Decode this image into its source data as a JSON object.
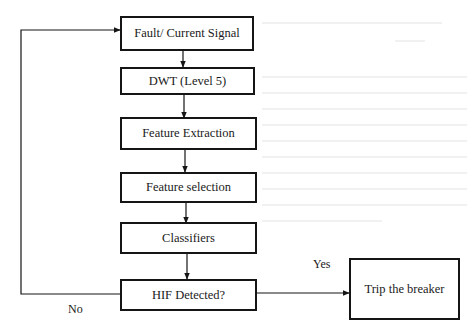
{
  "diagram": {
    "type": "flowchart",
    "nodes": [
      {
        "id": "signal",
        "label": "Fault/ Current Signal"
      },
      {
        "id": "dwt",
        "label": "DWT (Level 5)"
      },
      {
        "id": "extraction",
        "label": "Feature Extraction"
      },
      {
        "id": "selection",
        "label": "Feature selection"
      },
      {
        "id": "classifiers",
        "label": "Classifiers"
      },
      {
        "id": "decision",
        "label": "HIF Detected?"
      },
      {
        "id": "trip",
        "label": "Trip the breaker"
      }
    ],
    "edges": [
      {
        "from": "signal",
        "to": "dwt",
        "label": ""
      },
      {
        "from": "dwt",
        "to": "extraction",
        "label": ""
      },
      {
        "from": "extraction",
        "to": "selection",
        "label": ""
      },
      {
        "from": "selection",
        "to": "classifiers",
        "label": ""
      },
      {
        "from": "classifiers",
        "to": "decision",
        "label": ""
      },
      {
        "from": "decision",
        "to": "trip",
        "label": "Yes"
      },
      {
        "from": "decision",
        "to": "signal",
        "label": "No"
      }
    ],
    "edge_labels": {
      "yes": "Yes",
      "no": "No"
    },
    "colors": {
      "stroke": "#151515",
      "background": "#ffffff"
    }
  }
}
